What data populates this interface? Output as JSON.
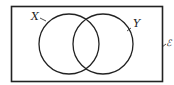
{
  "diagram": {
    "type": "venn",
    "universal_set_label": "ℰ",
    "sets": [
      {
        "label": "X"
      },
      {
        "label": "Y"
      }
    ],
    "stroke_color": "#222222",
    "background": "#ffffff"
  }
}
